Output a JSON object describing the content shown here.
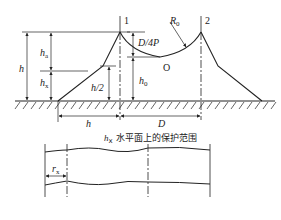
{
  "diagram": {
    "rods": [
      {
        "id": "rod-1",
        "label": "1"
      },
      {
        "id": "rod-2",
        "label": "2"
      }
    ],
    "labels": {
      "h_left": "h",
      "ha": "h",
      "ha_sub": "a",
      "hx": "h",
      "hx_sub": "x",
      "h_half": "h/2",
      "d4p": "D/4P",
      "h0": "h",
      "h0_sub": "0",
      "r0": "R",
      "r0_sub": "0",
      "center_o": "O",
      "h_bottom": "h",
      "d_bottom": "D",
      "rx": "r",
      "rx_sub": "x"
    },
    "caption": {
      "prefix": "h",
      "prefix_sub": "x",
      "text": " 水平面上的保护范围"
    },
    "colors": {
      "line": "#222222",
      "background": "#ffffff"
    }
  }
}
